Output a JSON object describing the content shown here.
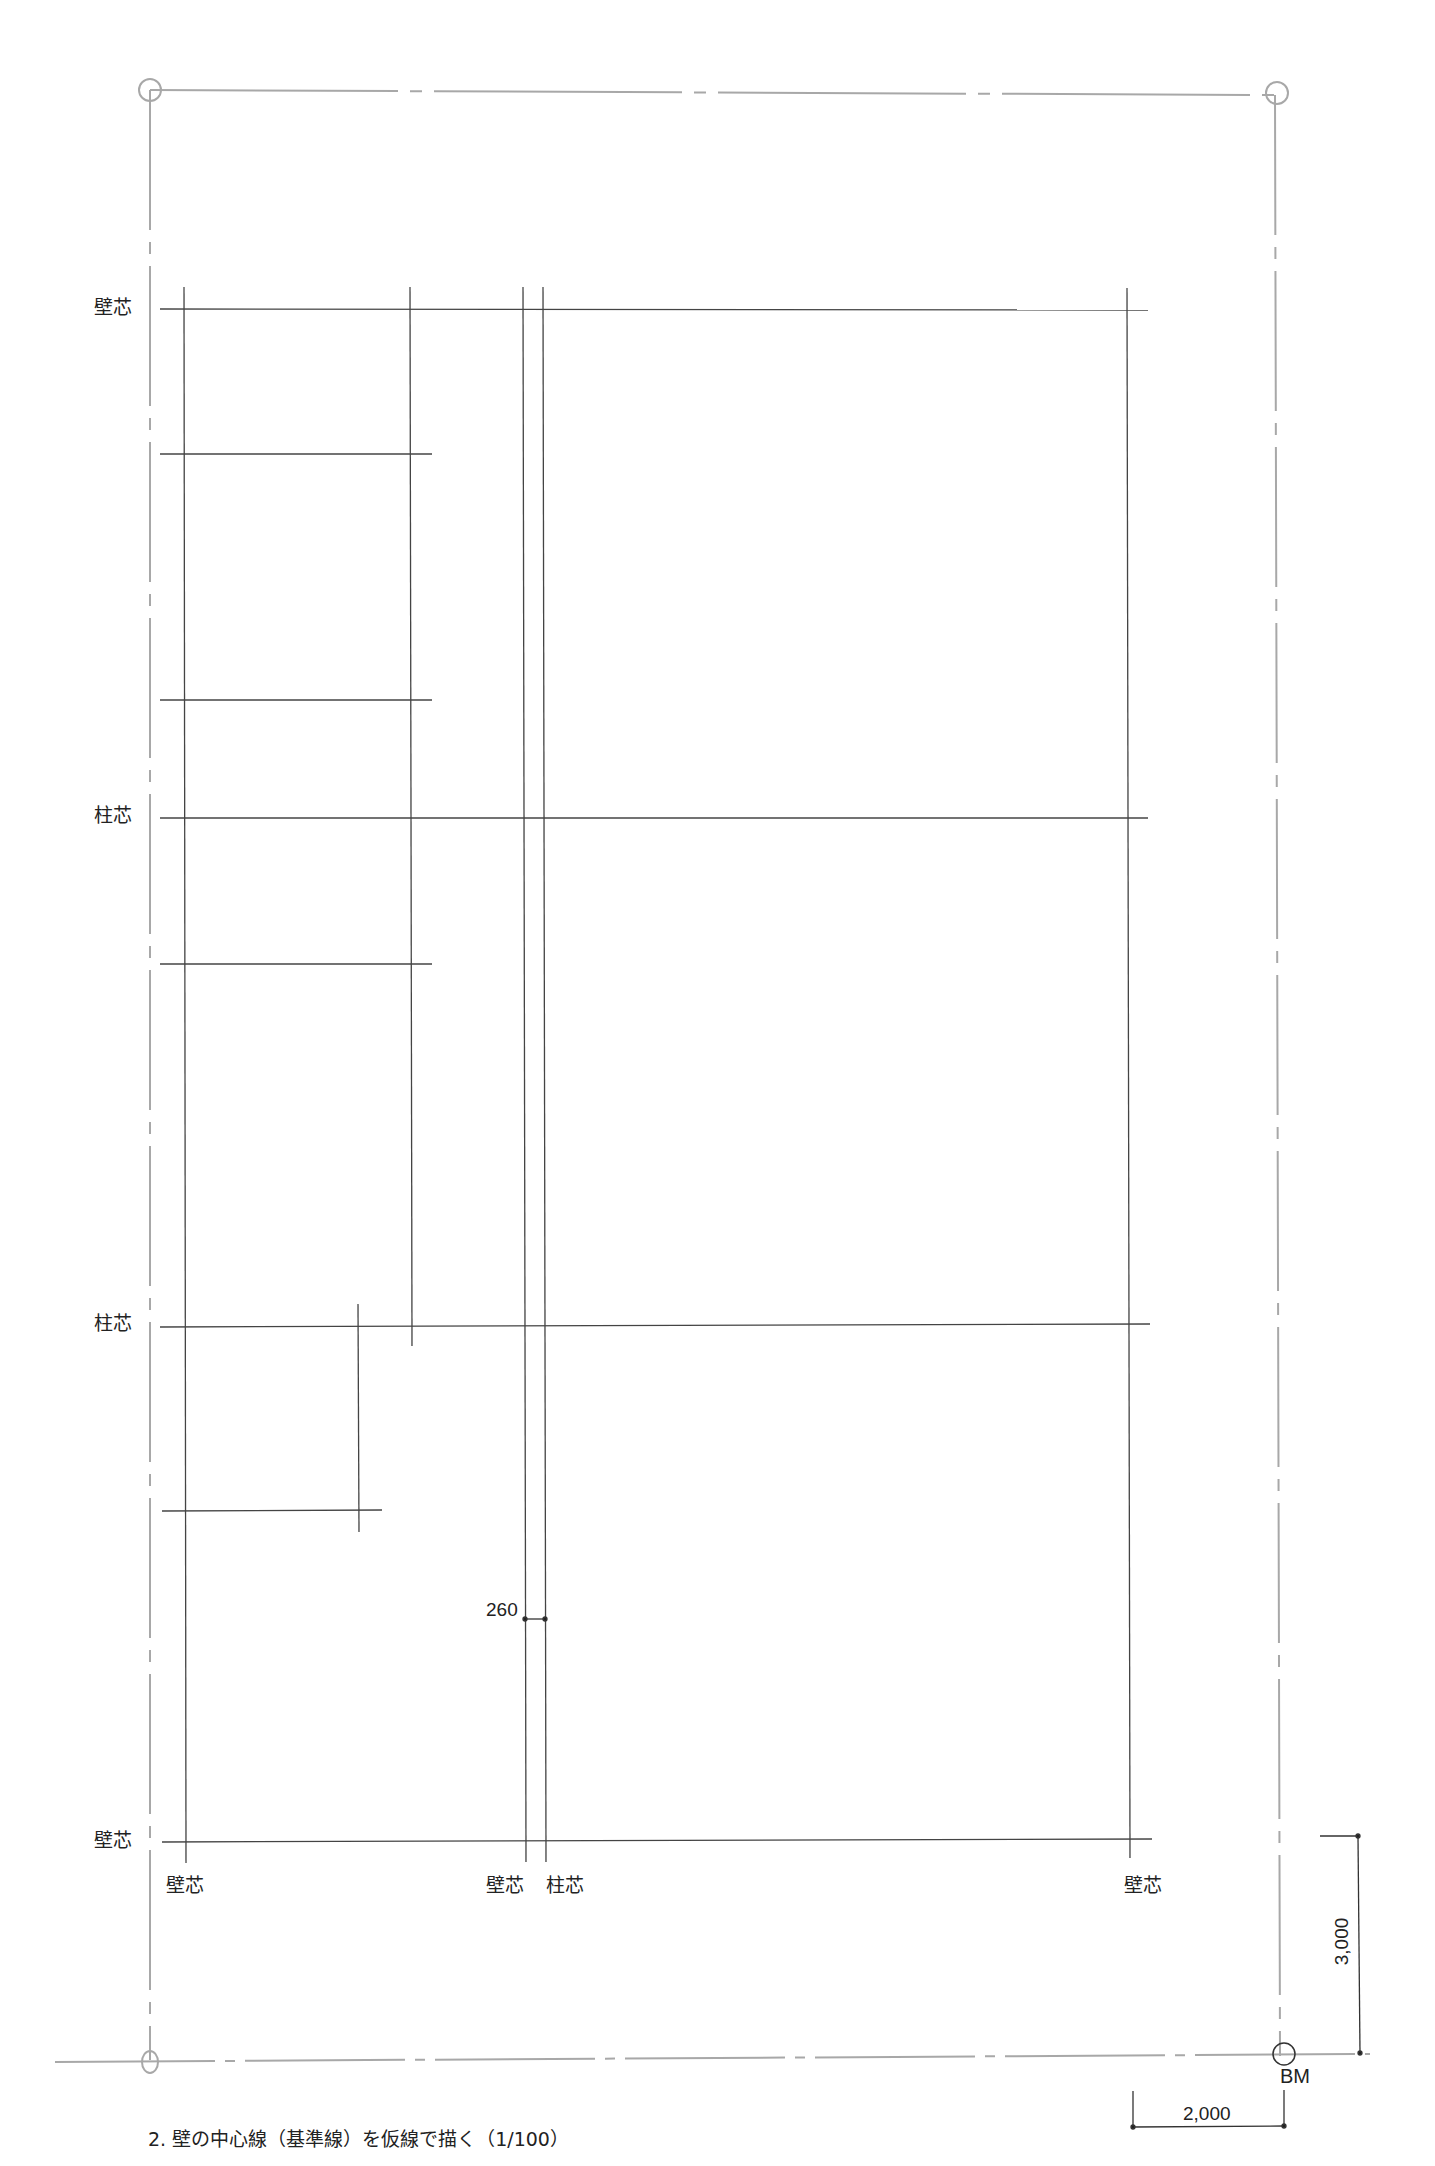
{
  "colors": {
    "boundary_line": "#a8a8a8",
    "grid_line": "#444444",
    "text": "#222222"
  },
  "site_boundary": {
    "corners": [
      [
        150,
        90
      ],
      [
        1275,
        95
      ],
      [
        1280,
        2056
      ],
      [
        150,
        2060
      ]
    ],
    "corner_markers": "circle",
    "line_style": "dash-dot"
  },
  "left_labels": [
    {
      "text": "壁芯",
      "x": 94,
      "y": 308
    },
    {
      "text": "柱芯",
      "x": 94,
      "y": 816
    },
    {
      "text": "柱芯",
      "x": 94,
      "y": 1324
    },
    {
      "text": "壁芯",
      "x": 94,
      "y": 1832
    }
  ],
  "bottom_labels": [
    {
      "text": "壁芯",
      "x": 166,
      "y": 1876
    },
    {
      "text": "壁芯",
      "x": 486,
      "y": 1876
    },
    {
      "text": "柱芯",
      "x": 546,
      "y": 1876
    },
    {
      "text": "壁芯",
      "x": 1124,
      "y": 1876
    }
  ],
  "horizontal_lines": [
    {
      "name": "wall-center-top",
      "x1": 160,
      "x2": 1148,
      "y": 309
    },
    {
      "name": "partition-1",
      "x1": 160,
      "x2": 432,
      "y": 454
    },
    {
      "name": "partition-2",
      "x1": 160,
      "x2": 432,
      "y": 700
    },
    {
      "name": "column-center-1",
      "x1": 160,
      "x2": 1148,
      "y": 818
    },
    {
      "name": "partition-3",
      "x1": 160,
      "x2": 432,
      "y": 964
    },
    {
      "name": "column-center-2",
      "x1": 160,
      "x2": 1150,
      "y": 1326
    },
    {
      "name": "partition-4",
      "x1": 162,
      "x2": 382,
      "y": 1510
    },
    {
      "name": "wall-center-bottom",
      "x1": 162,
      "x2": 1152,
      "y": 1841
    }
  ],
  "vertical_lines": [
    {
      "name": "wall-center-left",
      "x": 184,
      "y1": 287,
      "y2": 1863
    },
    {
      "name": "partition-vertical",
      "x": 410,
      "y1": 287,
      "y2": 1346
    },
    {
      "name": "partition-short",
      "x": 358,
      "y1": 1304,
      "y2": 1532
    },
    {
      "name": "wall-center-middle",
      "x": 523,
      "y1": 287,
      "y2": 1862
    },
    {
      "name": "column-center-middle",
      "x": 543,
      "y1": 287,
      "y2": 1862
    },
    {
      "name": "wall-center-right",
      "x": 1127,
      "y1": 288,
      "y2": 1858
    }
  ],
  "dimension_260": {
    "text": "260",
    "x1": 524,
    "x2": 544,
    "y": 1619,
    "label_x": 486,
    "label_y": 1600
  },
  "benchmark": {
    "label": "BM",
    "x": 1284,
    "y": 2054,
    "r": 11
  },
  "dimension_3000": {
    "text": "3,000",
    "x": 1358,
    "y1": 1836,
    "y2": 2053
  },
  "dimension_2000": {
    "text": "2,000",
    "x1": 1133,
    "x2": 1284,
    "y": 2126
  },
  "caption": "2. 壁の中心線（基準線）を仮線で描く（1/100）"
}
